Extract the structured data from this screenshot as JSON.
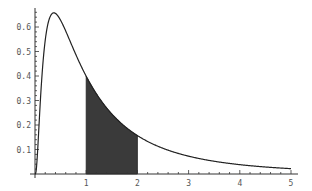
{
  "chart_data": {
    "type": "line",
    "title": "",
    "xlabel": "",
    "ylabel": "",
    "xlim": [
      0,
      5.1
    ],
    "ylim": [
      0,
      0.66
    ],
    "x_ticks": [
      1,
      2,
      3,
      4,
      5
    ],
    "x_tick_labels": [
      "1",
      "2",
      "3",
      "4",
      "5"
    ],
    "y_ticks": [
      0.1,
      0.2,
      0.3,
      0.4,
      0.5,
      0.6
    ],
    "y_tick_labels": [
      "0.1",
      "0.2",
      "0.3",
      "0.4",
      "0.5",
      "0.6"
    ],
    "grid": false,
    "legend": null,
    "series": [
      {
        "name": "density",
        "x": [
          0.05,
          0.1,
          0.2,
          0.3,
          0.368,
          0.5,
          0.75,
          1.0,
          1.25,
          1.5,
          2.0,
          2.5,
          3.0,
          3.5,
          4.0,
          4.5,
          5.0
        ],
        "values": [
          0.0,
          0.281,
          0.546,
          0.644,
          0.657,
          0.627,
          0.515,
          0.399,
          0.31,
          0.244,
          0.157,
          0.104,
          0.073,
          0.052,
          0.038,
          0.029,
          0.022
        ]
      }
    ],
    "shaded_region": {
      "x_from": 1,
      "x_to": 2,
      "color": "#3a3a3a"
    }
  },
  "colors": {
    "curve": "#222222",
    "fill": "#3a3a3a",
    "axis": "#333333",
    "label": "#555555"
  }
}
